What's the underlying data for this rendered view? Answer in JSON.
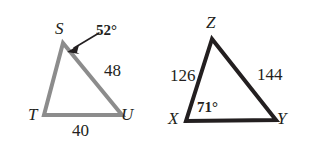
{
  "figure": {
    "canvas": {
      "width": 315,
      "height": 146,
      "background": "#ffffff"
    },
    "colors": {
      "left_triangle_stroke": "#8c8c8c",
      "right_triangle_stroke": "#231f20",
      "text": "#231f20",
      "arrow": "#231f20"
    },
    "triangles": [
      {
        "name": "triangle-STU",
        "stroke_color": "#8c8c8c",
        "stroke_width": 4,
        "vertices": [
          {
            "label": "S",
            "x": 63,
            "y": 43
          },
          {
            "label": "T",
            "x": 44,
            "y": 115
          },
          {
            "label": "U",
            "x": 122,
            "y": 115
          }
        ],
        "side_labels": [
          {
            "name": "side-SU",
            "text": "48"
          },
          {
            "name": "side-TU",
            "text": "40"
          }
        ],
        "angle_labels": [
          {
            "name": "angle-S",
            "text": "52°",
            "bold": true
          }
        ]
      },
      {
        "name": "triangle-XYZ",
        "stroke_color": "#231f20",
        "stroke_width": 4,
        "vertices": [
          {
            "label": "Z",
            "x": 212,
            "y": 39
          },
          {
            "label": "X",
            "x": 186,
            "y": 121
          },
          {
            "label": "Y",
            "x": 276,
            "y": 120
          }
        ],
        "side_labels": [
          {
            "name": "side-XZ",
            "text": "126"
          },
          {
            "name": "side-ZY",
            "text": "144"
          }
        ],
        "angle_labels": [
          {
            "name": "angle-X",
            "text": "71°",
            "bold": true
          }
        ]
      }
    ],
    "annotations": {
      "arrow": {
        "name": "angle-pointer-arrow",
        "from_x": 100,
        "from_y": 33,
        "to_x": 70,
        "to_y": 50
      }
    }
  },
  "labels": {
    "S": "S",
    "T": "T",
    "U": "U",
    "side_48": "48",
    "side_40": "40",
    "angle_52": "52°",
    "Z": "Z",
    "X": "X",
    "Y": "Y",
    "side_126": "126",
    "side_144": "144",
    "angle_71": "71°"
  }
}
